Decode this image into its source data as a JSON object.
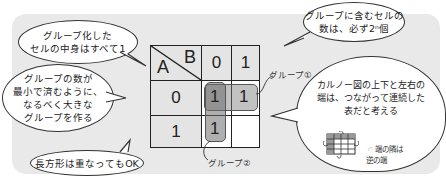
{
  "bubbles": {
    "all_ones": "グループ化した\nセルの中身はすべて1",
    "power_of_two": "グループに含むセルの\n数は、必ず2ⁿ個",
    "minimize_groups": "グループの数が\n最小で済むように、\nなるべく大きな\nグループを作る",
    "overlap_ok": "長方形は重なってもOK",
    "wraparound": "カルノー図の上下と左右の\n端は、つながって連続した\n表だと考える"
  },
  "kmap": {
    "row_var": "A",
    "col_var": "B",
    "col_headers": [
      "0",
      "1"
    ],
    "row_headers": [
      "0",
      "1"
    ],
    "cells": [
      [
        "1",
        "1"
      ],
      [
        "1",
        ""
      ]
    ],
    "groups": [
      {
        "label": "グループ①",
        "cells": "A=0,B=0 & A=0,B=1"
      },
      {
        "label": "グループ②",
        "cells": "A=0,B=0 & A=1,B=0"
      }
    ]
  },
  "labels": {
    "group1": "グループ①",
    "group2": "グループ②"
  },
  "mini_note": "☜ 端の隣は\n逆の端",
  "colors": {
    "panel": "#e9e9e9",
    "header_cell": "#e4e4e4",
    "group_fill": "#8a8a8a",
    "border": "#222222"
  }
}
